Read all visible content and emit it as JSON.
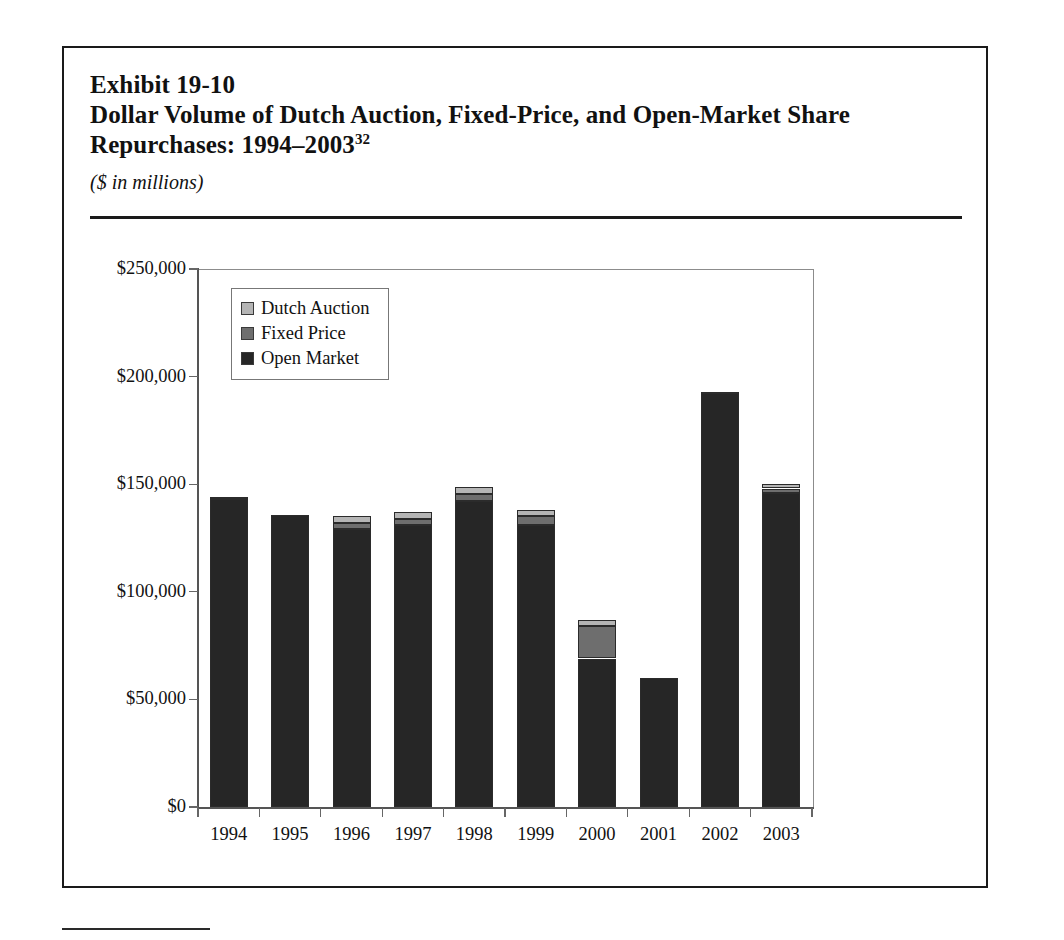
{
  "exhibit": {
    "label": "Exhibit 19-10",
    "title_line1": "Dollar Volume of Dutch Auction, Fixed-Price, and Open-Market Share",
    "title_line2_main": "Repurchases: 1994–2003",
    "title_line2_footnote": "32",
    "subtitle": "($ in millions)"
  },
  "legend": {
    "items": [
      {
        "label": "Dutch Auction",
        "color": "#b5b5b5",
        "key": "dutch"
      },
      {
        "label": "Fixed Price",
        "color": "#6e6e6e",
        "key": "fixed"
      },
      {
        "label": "Open Market",
        "color": "#262626",
        "key": "open"
      }
    ]
  },
  "axes": {
    "y_ticks": [
      "$250,000",
      "$200,000",
      "$150,000",
      "$100,000",
      "$50,000",
      "$0"
    ],
    "y_tick_values": [
      250000,
      200000,
      150000,
      100000,
      50000,
      0
    ],
    "x_ticks": [
      "1994",
      "1995",
      "1996",
      "1997",
      "1998",
      "1999",
      "2000",
      "2001",
      "2002",
      "2003"
    ]
  },
  "chart_data": {
    "type": "bar",
    "stacked": true,
    "title": "Dollar Volume of Dutch Auction, Fixed-Price, and Open-Market Share Repurchases: 1994–2003",
    "subtitle": "($ in millions)",
    "xlabel": "",
    "ylabel": "",
    "ylim": [
      0,
      250000
    ],
    "ytick_step": 50000,
    "grid": false,
    "legend_position": "inside-top-left",
    "categories": [
      "1994",
      "1995",
      "1996",
      "1997",
      "1998",
      "1999",
      "2000",
      "2001",
      "2002",
      "2003"
    ],
    "series": [
      {
        "name": "Open Market",
        "color": "#262626",
        "values": [
          143000,
          135500,
          129000,
          131000,
          142000,
          131000,
          69000,
          60000,
          192500,
          146000
        ]
      },
      {
        "name": "Fixed Price",
        "color": "#6e6e6e",
        "values": [
          900,
          0,
          3200,
          3000,
          3500,
          4000,
          15000,
          0,
          500,
          2000
        ]
      },
      {
        "name": "Dutch Auction",
        "color": "#b5b5b5",
        "values": [
          0,
          0,
          3000,
          3000,
          3000,
          3000,
          3000,
          0,
          0,
          2000
        ]
      }
    ],
    "totals": [
      143900,
      135500,
      135200,
      137000,
      148500,
      138000,
      87000,
      60000,
      193000,
      150000
    ]
  }
}
